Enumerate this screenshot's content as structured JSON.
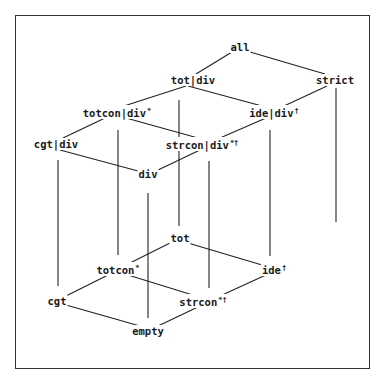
{
  "diagram": {
    "type": "lattice",
    "nodes": [
      {
        "id": "all",
        "label": "all",
        "sup": "",
        "x": 240,
        "y": 47
      },
      {
        "id": "tot_div",
        "label": "tot|div",
        "sup": "",
        "x": 193,
        "y": 80
      },
      {
        "id": "strict",
        "label": "strict",
        "sup": "",
        "x": 335,
        "y": 80
      },
      {
        "id": "totcon_div",
        "label": "totcon|div",
        "sup": "*",
        "x": 117,
        "y": 112
      },
      {
        "id": "ide_div",
        "label": "ide|div",
        "sup": "†",
        "x": 274,
        "y": 112
      },
      {
        "id": "cgt_div",
        "label": "cgt|div",
        "sup": "",
        "x": 56,
        "y": 144
      },
      {
        "id": "strcon_div",
        "label": "strcon|div",
        "sup": "*†",
        "x": 202,
        "y": 144
      },
      {
        "id": "div",
        "label": "div",
        "sup": "",
        "x": 148,
        "y": 174
      },
      {
        "id": "tot",
        "label": "tot",
        "sup": "",
        "x": 180,
        "y": 238
      },
      {
        "id": "totcon",
        "label": "totcon",
        "sup": "*",
        "x": 118,
        "y": 269
      },
      {
        "id": "ide",
        "label": "ide",
        "sup": "†",
        "x": 274,
        "y": 269
      },
      {
        "id": "cgt",
        "label": "cgt",
        "sup": "",
        "x": 57,
        "y": 301
      },
      {
        "id": "strcon",
        "label": "strcon",
        "sup": "*†",
        "x": 203,
        "y": 301
      },
      {
        "id": "empty",
        "label": "empty",
        "sup": "",
        "x": 148,
        "y": 331
      }
    ],
    "edges": [
      {
        "from": "all",
        "to": "tot_div",
        "x1": 232,
        "y1": 52,
        "x2": 196,
        "y2": 74
      },
      {
        "from": "all",
        "to": "strict",
        "x1": 250,
        "y1": 52,
        "x2": 325,
        "y2": 74
      },
      {
        "from": "tot_div",
        "to": "totcon_div",
        "x1": 186,
        "y1": 86,
        "x2": 124,
        "y2": 106
      },
      {
        "from": "tot_div",
        "to": "ide_div",
        "x1": 188,
        "y1": 86,
        "x2": 262,
        "y2": 106
      },
      {
        "from": "strict",
        "to": "ide_div",
        "x1": 327,
        "y1": 86,
        "x2": 284,
        "y2": 106
      },
      {
        "from": "totcon_div",
        "to": "cgt_div",
        "x1": 105,
        "y1": 118,
        "x2": 63,
        "y2": 138
      },
      {
        "from": "totcon_div",
        "to": "strcon_div",
        "x1": 126,
        "y1": 118,
        "x2": 198,
        "y2": 138
      },
      {
        "from": "ide_div",
        "to": "strcon_div",
        "x1": 266,
        "y1": 118,
        "x2": 220,
        "y2": 138
      },
      {
        "from": "cgt_div",
        "to": "div",
        "x1": 60,
        "y1": 150,
        "x2": 138,
        "y2": 171
      },
      {
        "from": "strcon_div",
        "to": "div",
        "x1": 200,
        "y1": 150,
        "x2": 158,
        "y2": 170
      },
      {
        "from": "tot",
        "to": "totcon",
        "x1": 170,
        "y1": 243,
        "x2": 130,
        "y2": 263
      },
      {
        "from": "tot",
        "to": "ide",
        "x1": 188,
        "y1": 243,
        "x2": 262,
        "y2": 265
      },
      {
        "from": "totcon",
        "to": "cgt",
        "x1": 108,
        "y1": 275,
        "x2": 66,
        "y2": 296
      },
      {
        "from": "totcon",
        "to": "strcon",
        "x1": 128,
        "y1": 275,
        "x2": 196,
        "y2": 296
      },
      {
        "from": "ide",
        "to": "strcon",
        "x1": 268,
        "y1": 274,
        "x2": 220,
        "y2": 296
      },
      {
        "from": "cgt",
        "to": "empty",
        "x1": 66,
        "y1": 305,
        "x2": 140,
        "y2": 326
      },
      {
        "from": "strcon",
        "to": "empty",
        "x1": 200,
        "y1": 306,
        "x2": 158,
        "y2": 326
      },
      {
        "from": "cgt_div",
        "to": "cgt",
        "x1": 58,
        "y1": 160,
        "x2": 58,
        "y2": 286
      },
      {
        "from": "totcon_div",
        "to": "totcon",
        "x1": 118,
        "y1": 130,
        "x2": 118,
        "y2": 255
      },
      {
        "from": "div",
        "to": "empty",
        "x1": 148,
        "y1": 193,
        "x2": 148,
        "y2": 318
      },
      {
        "from": "tot_div",
        "to": "tot",
        "x1": 179,
        "y1": 100,
        "x2": 179,
        "y2": 226
      },
      {
        "from": "strcon_div",
        "to": "strcon",
        "x1": 209,
        "y1": 161,
        "x2": 209,
        "y2": 288
      },
      {
        "from": "ide_div",
        "to": "ide",
        "x1": 270,
        "y1": 130,
        "x2": 270,
        "y2": 256
      },
      {
        "from": "strict",
        "to": "ide_down",
        "x1": 336,
        "y1": 88,
        "x2": 336,
        "y2": 222
      }
    ]
  }
}
